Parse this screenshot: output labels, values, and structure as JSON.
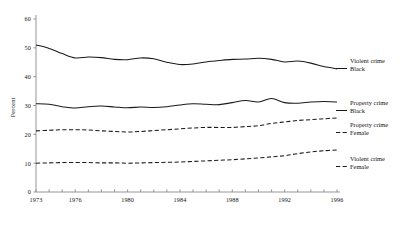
{
  "chart_data": {
    "type": "line",
    "title": "",
    "subtitle": "",
    "xlabel": "",
    "ylabel": "Percent",
    "xlim": [
      1973,
      1996
    ],
    "ylim": [
      0,
      60
    ],
    "grid": false,
    "legend_position": "right",
    "y_ticks": [
      0,
      10,
      20,
      30,
      40,
      50,
      60
    ],
    "y_tick_labels": [
      "0",
      "10",
      "20",
      "30",
      "40",
      "50",
      "60"
    ],
    "x_ticks": [
      1973,
      1974,
      1975,
      1976,
      1977,
      1978,
      1979,
      1980,
      1981,
      1982,
      1983,
      1984,
      1985,
      1986,
      1987,
      1988,
      1989,
      1990,
      1991,
      1992,
      1993,
      1994,
      1995,
      1996
    ],
    "x_tick_labels_shown": [
      "1973",
      "1976",
      "1980",
      "1984",
      "1988",
      "1992",
      "1996"
    ],
    "x_tick_label_years": [
      1973,
      1976,
      1980,
      1984,
      1988,
      1992,
      1996
    ],
    "x": [
      1973,
      1974,
      1975,
      1976,
      1977,
      1978,
      1979,
      1980,
      1981,
      1982,
      1983,
      1984,
      1985,
      1986,
      1987,
      1988,
      1989,
      1990,
      1991,
      1992,
      1993,
      1994,
      1995,
      1996
    ],
    "series": [
      {
        "name": "Violent crime Black",
        "label_line1": "Violent crime",
        "label_line2": "Black",
        "style": "solid",
        "color": "#1a1a1a",
        "values": [
          51.0,
          49.8,
          48.0,
          46.5,
          46.8,
          46.6,
          46.0,
          45.9,
          46.5,
          46.2,
          45.0,
          44.2,
          44.4,
          45.1,
          45.6,
          46.0,
          46.1,
          46.4,
          46.0,
          45.1,
          45.4,
          44.7,
          43.5,
          42.7
        ]
      },
      {
        "name": "Property crime Black",
        "label_line1": "Property crime",
        "label_line2": "Black",
        "style": "solid",
        "color": "#1a1a1a",
        "values": [
          30.6,
          30.4,
          29.6,
          29.1,
          29.6,
          29.8,
          29.5,
          29.2,
          29.5,
          29.3,
          29.6,
          30.2,
          30.6,
          30.4,
          30.3,
          31.0,
          31.7,
          31.2,
          32.4,
          31.0,
          30.8,
          31.2,
          31.4,
          31.2
        ]
      },
      {
        "name": "Property crime Female",
        "label_line1": "Property crime",
        "label_line2": "Female",
        "style": "dashed",
        "color": "#1a1a1a",
        "values": [
          21.2,
          21.4,
          21.6,
          21.6,
          21.5,
          21.2,
          21.0,
          20.8,
          21.0,
          21.3,
          21.6,
          21.9,
          22.2,
          22.4,
          22.4,
          22.4,
          22.7,
          23.0,
          23.8,
          24.3,
          24.8,
          25.1,
          25.4,
          25.7
        ]
      },
      {
        "name": "Violent crime Female",
        "label_line1": "Violent crime",
        "label_line2": "Female",
        "style": "dashed",
        "color": "#1a1a1a",
        "values": [
          10.0,
          10.1,
          10.2,
          10.2,
          10.2,
          10.1,
          10.1,
          10.0,
          10.1,
          10.2,
          10.3,
          10.4,
          10.6,
          10.8,
          11.0,
          11.2,
          11.5,
          11.8,
          12.2,
          12.6,
          13.3,
          13.9,
          14.3,
          14.6
        ]
      }
    ]
  },
  "axis": {
    "y_title": "Percent"
  }
}
